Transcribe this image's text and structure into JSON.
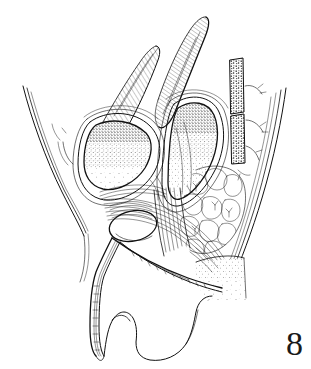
{
  "figure": {
    "number": "8",
    "caption_text": "",
    "medium": "pen-and-ink line drawing",
    "background_color": "#ffffff",
    "ink_color": "#111111",
    "label_position": "bottom-right"
  },
  "canvas": {
    "width": 311,
    "height": 369
  },
  "structures": [
    {
      "id": "abdominal-wall",
      "name": "anterior abdominal wall contour",
      "texture": "multiple parallel contour lines",
      "location": "left edge"
    },
    {
      "id": "bladder",
      "name": "urinary bladder",
      "texture": "stipple",
      "location": "left-centre"
    },
    {
      "id": "rectum",
      "name": "rectum",
      "texture": "graded stipple, dense superiorly",
      "location": "centre-right"
    },
    {
      "id": "abdominal-muscle-bands",
      "name": "muscle bands",
      "texture": "fine diagonal hatching",
      "location": "upper centre"
    },
    {
      "id": "sacral-vertebrae",
      "name": "sacral vertebral segments",
      "texture": "coarse stipple / cancellous bone",
      "location": "upper right"
    },
    {
      "id": "adipose-tissue",
      "name": "ischiorectal fat",
      "texture": "lobular cell outlines",
      "location": "right-centre"
    },
    {
      "id": "prostate",
      "name": "prostate gland",
      "texture": "plain white outline",
      "location": "lower centre"
    },
    {
      "id": "levator-ani",
      "name": "levator ani / sphincter fibres",
      "texture": "dense parallel line bundles",
      "location": "lower centre"
    },
    {
      "id": "urethra",
      "name": "urethra and penile shaft",
      "texture": "parallel channel lines",
      "location": "lower left"
    },
    {
      "id": "scrotum",
      "name": "scrotum / testis outline",
      "texture": "plain outline",
      "location": "bottom centre"
    },
    {
      "id": "perineal-wedge",
      "name": "perineal body region",
      "texture": "sparse stipple",
      "location": "lower right"
    },
    {
      "id": "posterior-contour",
      "name": "posterior body contour",
      "texture": "parallel curved lines",
      "location": "right edge"
    }
  ]
}
